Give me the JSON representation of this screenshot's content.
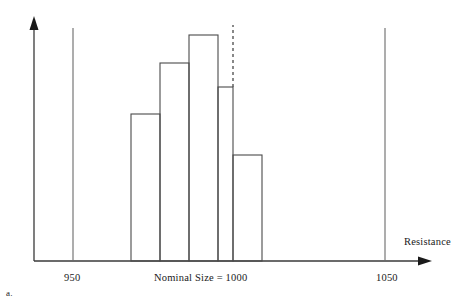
{
  "figure": {
    "panel_label": "a.",
    "background_color": "#ffffff",
    "line_color": "#3a3a3a",
    "text_color": "#1a1a1a"
  },
  "axes": {
    "x_axis_title": "Resistance",
    "y_axis_title": "",
    "x_axis_arrow": "arrow-right-icon",
    "y_axis_arrow": "arrow-up-icon"
  },
  "annotations": {
    "nominal": "Nominal Size = 1000",
    "spec_limit_lower_label": "950",
    "spec_limit_upper_label": "1050"
  },
  "chart_data": {
    "type": "bar",
    "title": "",
    "subtitle": "",
    "xlabel": "Resistance",
    "ylabel": "",
    "grid": false,
    "legend": null,
    "categories": [
      "bin-1",
      "bin-2",
      "bin-3",
      "bin-4",
      "bin-5"
    ],
    "values": [
      47,
      98,
      126,
      74,
      26
    ],
    "bar_edges_px": [
      {
        "x0": 131,
        "x1": 160,
        "top_y": 114
      },
      {
        "x0": 160,
        "x1": 189,
        "top_y": 63
      },
      {
        "x0": 189,
        "x1": 218,
        "top_y": 35
      },
      {
        "x0": 218,
        "x1": 233,
        "top_y": 87
      },
      {
        "x0": 233,
        "x1": 262,
        "top_y": 155
      }
    ],
    "baseline_y": 261,
    "xlim": [
      950,
      1050
    ],
    "ylim": [
      0,
      135
    ],
    "reference_lines": [
      {
        "name": "lower-spec-limit",
        "label": "950",
        "x_px": 73,
        "style": "solid"
      },
      {
        "name": "nominal-center-line",
        "label": "Nominal Size = 1000",
        "x_px": 233,
        "style": "dashed"
      },
      {
        "name": "upper-spec-limit",
        "label": "1050",
        "x_px": 385,
        "style": "solid"
      }
    ]
  }
}
